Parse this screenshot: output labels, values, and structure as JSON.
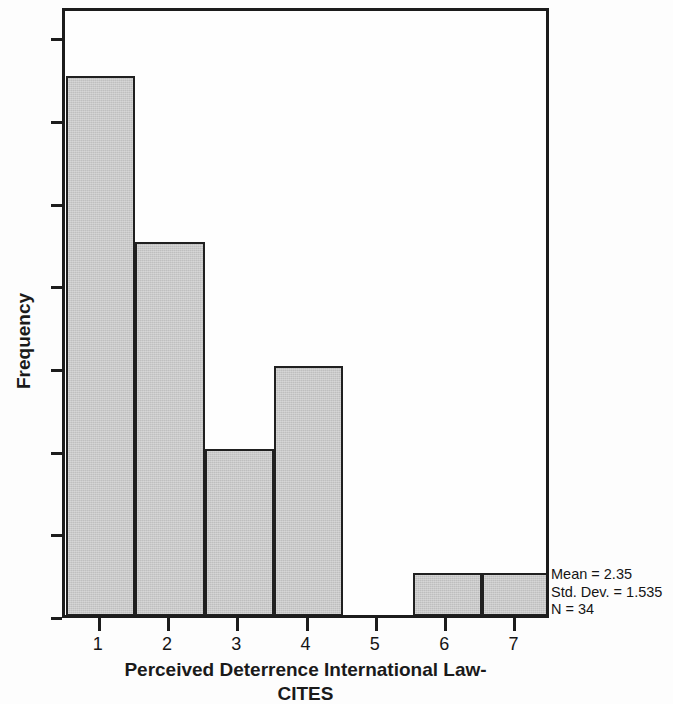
{
  "chart_data": {
    "type": "bar",
    "title": "",
    "xlabel": "Perceived Deterrence International Law-CITES",
    "xlabel_line1": "Perceived Deterrence International Law-",
    "xlabel_line2": "CITES",
    "ylabel": "Frequency",
    "categories": [
      "1",
      "2",
      "3",
      "4",
      "5",
      "6",
      "7"
    ],
    "values": [
      13,
      9,
      4,
      6,
      0,
      1,
      1
    ],
    "xtick_labels": [
      "1",
      "2",
      "3",
      "4",
      "5",
      "6",
      "7"
    ],
    "ytick_labels": [
      "0",
      "2",
      "4",
      "6",
      "8",
      "10",
      "12",
      "14"
    ],
    "ytick_values": [
      0,
      2,
      4,
      6,
      8,
      10,
      12,
      14
    ],
    "ylim": [
      0,
      14.7
    ],
    "xlim": [
      0.5,
      7.5
    ],
    "grid": false,
    "legend": null,
    "bar_fill_color": "#c9c9c9",
    "bar_edge_color": "#202020",
    "axis_color": "#1c1c1c",
    "annotations": {
      "mean": "Mean = 2.35",
      "std_dev": "Std. Dev. = 1.535",
      "n": "N = 34",
      "mean_value": 2.35,
      "std_dev_value": 1.535,
      "n_value": 34
    }
  }
}
